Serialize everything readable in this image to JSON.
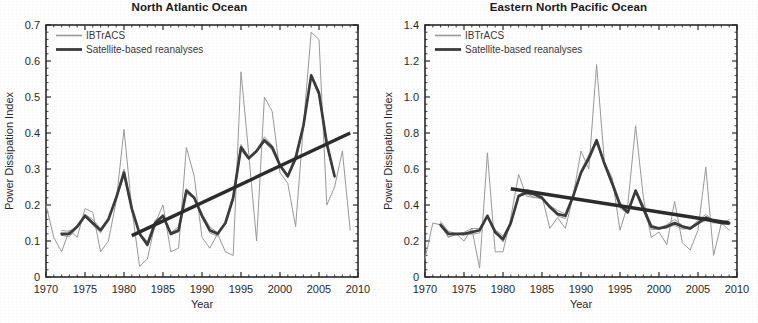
{
  "figure": {
    "background": "#ffffff",
    "panel_count": 2
  },
  "panels": [
    {
      "id": "north-atlantic",
      "title": "North Atlantic Ocean"
    },
    {
      "id": "eastern-north-pacific",
      "title": "Eastern North Pacific Ocean"
    }
  ],
  "chart_data": [
    {
      "type": "line",
      "title": "North Atlantic Ocean",
      "xlabel": "Year",
      "ylabel": "Power Dissipation Index",
      "xlim": [
        1970,
        2010
      ],
      "ylim": [
        0,
        0.7
      ],
      "xticks": [
        1970,
        1975,
        1980,
        1985,
        1990,
        1995,
        2000,
        2005,
        2010
      ],
      "xtick_labels": [
        "1970",
        "1975",
        "1980",
        "1985",
        "1990",
        "1995",
        "2000",
        "2005",
        "2010"
      ],
      "yticks": [
        0,
        0.1,
        0.2,
        0.3,
        0.4,
        0.5,
        0.6,
        0.7
      ],
      "ytick_labels": [
        "0",
        "0.1",
        "0.2",
        "0.3",
        "0.4",
        "0.5",
        "0.6",
        "0.7"
      ],
      "grid": false,
      "legend_position": "top-left",
      "legend": [
        {
          "name": "IBTrACS",
          "color": "#9a9a9a",
          "width": 1.1
        },
        {
          "name": "Satellite-based reanalyses",
          "color": "#3c3c3c",
          "width": 2.6
        }
      ],
      "series": [
        {
          "name": "IBTrACS",
          "color": "#9a9a9a",
          "x": [
            1970,
            1971,
            1972,
            1973,
            1974,
            1975,
            1976,
            1977,
            1978,
            1979,
            1980,
            1981,
            1982,
            1983,
            1984,
            1985,
            1986,
            1987,
            1988,
            1989,
            1990,
            1991,
            1992,
            1993,
            1994,
            1995,
            1996,
            1997,
            1998,
            1999,
            2000,
            2001,
            2002,
            2003,
            2004,
            2005,
            2006,
            2007,
            2008,
            2009
          ],
          "values": [
            0.2,
            0.11,
            0.07,
            0.13,
            0.11,
            0.19,
            0.18,
            0.07,
            0.1,
            0.21,
            0.41,
            0.19,
            0.03,
            0.05,
            0.15,
            0.2,
            0.07,
            0.08,
            0.36,
            0.28,
            0.11,
            0.08,
            0.12,
            0.07,
            0.06,
            0.57,
            0.34,
            0.1,
            0.5,
            0.46,
            0.29,
            0.26,
            0.14,
            0.42,
            0.68,
            0.66,
            0.2,
            0.25,
            0.35,
            0.13
          ]
        },
        {
          "name": "Satellite-based reanalyses",
          "color": "#3c3c3c",
          "x": [
            1972,
            1973,
            1974,
            1975,
            1976,
            1977,
            1978,
            1979,
            1980,
            1981,
            1982,
            1983,
            1984,
            1985,
            1986,
            1987,
            1988,
            1989,
            1990,
            1991,
            1992,
            1993,
            1994,
            1995,
            1996,
            1997,
            1998,
            1999,
            2000,
            2001,
            2002,
            2003,
            2004,
            2005,
            2006,
            2007
          ],
          "values": [
            0.12,
            0.12,
            0.14,
            0.17,
            0.15,
            0.13,
            0.16,
            0.22,
            0.29,
            0.19,
            0.12,
            0.09,
            0.15,
            0.17,
            0.12,
            0.13,
            0.24,
            0.22,
            0.17,
            0.13,
            0.12,
            0.15,
            0.22,
            0.36,
            0.33,
            0.35,
            0.38,
            0.36,
            0.31,
            0.28,
            0.33,
            0.42,
            0.56,
            0.51,
            0.37,
            0.28
          ]
        }
      ],
      "trend": {
        "name": "Satellite-based reanalyses trend",
        "color": "#2c2c2c",
        "x": [
          1981,
          2009
        ],
        "values": [
          0.115,
          0.4
        ]
      }
    },
    {
      "type": "line",
      "title": "Eastern North Pacific Ocean",
      "xlabel": "Year",
      "ylabel": "Power Dissipation Index",
      "xlim": [
        1970,
        2010
      ],
      "ylim": [
        0,
        1.4
      ],
      "xticks": [
        1970,
        1975,
        1980,
        1985,
        1990,
        1995,
        2000,
        2005,
        2010
      ],
      "xtick_labels": [
        "1970",
        "1975",
        "1980",
        "1985",
        "1990",
        "1995",
        "2000",
        "2005",
        "2010"
      ],
      "yticks": [
        0,
        0.2,
        0.4,
        0.6,
        0.8,
        1.0,
        1.2,
        1.4
      ],
      "ytick_labels": [
        "0",
        "0.2",
        "0.4",
        "0.6",
        "0.8",
        "1.0",
        "1.2",
        "1.4"
      ],
      "grid": false,
      "legend_position": "top-left",
      "legend": [
        {
          "name": "IBTrACS",
          "color": "#9a9a9a",
          "width": 1.1
        },
        {
          "name": "Satellite-based reanalyses",
          "color": "#3c3c3c",
          "width": 2.6
        }
      ],
      "series": [
        {
          "name": "IBTrACS",
          "color": "#9a9a9a",
          "x": [
            1970,
            1971,
            1972,
            1973,
            1974,
            1975,
            1976,
            1977,
            1978,
            1979,
            1980,
            1981,
            1982,
            1983,
            1984,
            1985,
            1986,
            1987,
            1988,
            1989,
            1990,
            1991,
            1992,
            1993,
            1994,
            1995,
            1996,
            1997,
            1998,
            1999,
            2000,
            2001,
            2002,
            2003,
            2004,
            2005,
            2006,
            2007,
            2008,
            2009
          ],
          "values": [
            0.1,
            0.3,
            0.29,
            0.22,
            0.24,
            0.2,
            0.27,
            0.05,
            0.69,
            0.14,
            0.14,
            0.33,
            0.57,
            0.45,
            0.44,
            0.45,
            0.27,
            0.33,
            0.27,
            0.45,
            0.7,
            0.6,
            1.18,
            0.64,
            0.55,
            0.26,
            0.4,
            0.84,
            0.44,
            0.22,
            0.25,
            0.18,
            0.42,
            0.19,
            0.15,
            0.26,
            0.61,
            0.12,
            0.3,
            0.26
          ]
        },
        {
          "name": "Satellite-based reanalyses",
          "color": "#3c3c3c",
          "x": [
            1972,
            1973,
            1974,
            1975,
            1976,
            1977,
            1978,
            1979,
            1980,
            1981,
            1982,
            1983,
            1984,
            1985,
            1986,
            1987,
            1988,
            1989,
            1990,
            1991,
            1992,
            1993,
            1994,
            1995,
            1996,
            1997,
            1998,
            1999,
            2000,
            2001,
            2002,
            2003,
            2004,
            2005,
            2006,
            2007,
            2008,
            2009
          ],
          "values": [
            0.29,
            0.24,
            0.24,
            0.24,
            0.25,
            0.26,
            0.34,
            0.25,
            0.21,
            0.3,
            0.45,
            0.47,
            0.46,
            0.44,
            0.39,
            0.35,
            0.34,
            0.45,
            0.58,
            0.66,
            0.76,
            0.63,
            0.52,
            0.4,
            0.36,
            0.48,
            0.38,
            0.28,
            0.27,
            0.28,
            0.3,
            0.28,
            0.27,
            0.3,
            0.33,
            0.31,
            0.3,
            0.3
          ]
        }
      ],
      "trend": {
        "name": "Satellite-based reanalyses trend",
        "color": "#2c2c2c",
        "x": [
          1981,
          2009
        ],
        "values": [
          0.49,
          0.3
        ]
      }
    }
  ]
}
